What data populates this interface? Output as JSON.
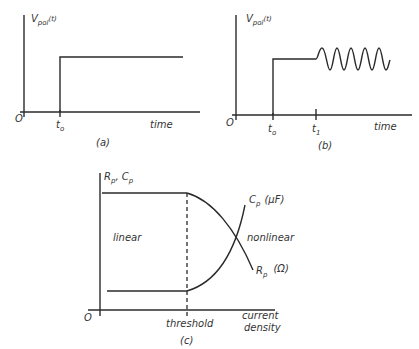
{
  "panels": {
    "a": {
      "caption": "(a)",
      "y_label_main": "V",
      "y_label_sub": "pol",
      "y_label_arg": "(t)",
      "origin": "O",
      "t0_main": "t",
      "t0_sub": "o",
      "x_label": "time"
    },
    "b": {
      "caption": "(b)",
      "y_label_main": "V",
      "y_label_sub": "pol",
      "y_label_arg": "(t)",
      "origin": "O",
      "t0_main": "t",
      "t0_sub": "o",
      "t1_main": "t",
      "t1_sub": "1",
      "x_label": "time"
    },
    "c": {
      "caption": "(c)",
      "y_label_r": "R",
      "y_label_r_sub": "p",
      "y_label_sep": ", ",
      "y_label_c": "C",
      "y_label_c_sub": "p",
      "origin": "O",
      "threshold": "threshold",
      "x_label_line1": "current",
      "x_label_line2": "density",
      "region_linear": "linear",
      "region_nonlinear": "nonlinear",
      "cp_label": "C",
      "cp_sub": "p",
      "cp_unit": "(μF)",
      "rp_label": "R",
      "rp_sub": "p",
      "rp_unit": "(Ω)"
    }
  },
  "colors": {
    "ink": "#2a2a2a",
    "background": "#ffffff"
  }
}
